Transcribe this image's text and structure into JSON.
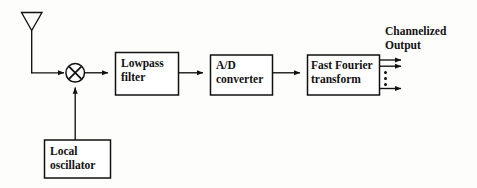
{
  "diagram": {
    "type": "block-diagram",
    "stroke_color": "#111111",
    "fill_color": "#ffffff",
    "background_color": "#fdfdfb",
    "blocks": [
      {
        "id": "antenna",
        "shape": "antenna-triangle",
        "label": ""
      },
      {
        "id": "mixer",
        "shape": "circle-x",
        "label": ""
      },
      {
        "id": "lowpass_filter",
        "shape": "rect",
        "label_line1": "Lowpass",
        "label_line2": "filter"
      },
      {
        "id": "ad_converter",
        "shape": "rect",
        "label_line1": "A/D",
        "label_line2": "converter"
      },
      {
        "id": "fft",
        "shape": "rect",
        "label_line1": "Fast Fourier",
        "label_line2": "transform"
      },
      {
        "id": "local_oscillator",
        "shape": "rect",
        "label_line1": "Local",
        "label_line2": "oscillator"
      }
    ],
    "output_label": {
      "line1": "Channelized",
      "line2": "Output"
    },
    "output_arrows": {
      "count_visible": 3,
      "ellipsis_dots": 3
    },
    "signal_flow": [
      "antenna",
      "mixer",
      "lowpass_filter",
      "ad_converter",
      "fft",
      "channelized-output"
    ],
    "connections": [
      {
        "from": "antenna",
        "to": "mixer",
        "style": "elbow-arrow"
      },
      {
        "from": "local_oscillator",
        "to": "mixer",
        "style": "vertical-arrow-up"
      },
      {
        "from": "mixer",
        "to": "lowpass_filter",
        "style": "arrow"
      },
      {
        "from": "lowpass_filter",
        "to": "ad_converter",
        "style": "arrow"
      },
      {
        "from": "ad_converter",
        "to": "fft",
        "style": "arrow"
      },
      {
        "from": "fft",
        "to": "channelized-output",
        "style": "multi-arrow"
      }
    ]
  }
}
